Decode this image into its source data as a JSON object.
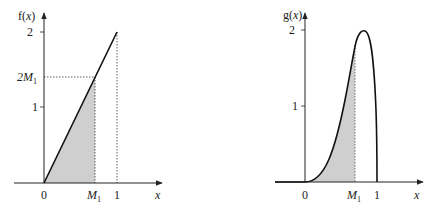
{
  "chart_data": [
    {
      "type": "line",
      "title": "",
      "ylabel": "f(x)",
      "xlabel": "x",
      "function": "f(x) = 2x on [0,1]",
      "x": [
        0,
        0.7,
        1
      ],
      "values": [
        0,
        1.4,
        2
      ],
      "x_ticks": [
        "0",
        "M1",
        "1"
      ],
      "y_ticks": [
        "1",
        "2M1",
        "2"
      ],
      "y_tick_values": [
        1,
        1.4,
        2
      ],
      "shaded_region": {
        "from": 0,
        "to": "M1",
        "color": "#cfcfcf"
      },
      "reference_lines": [
        "dotted horizontal at 2M1",
        "dotted vertical at M1",
        "dotted vertical at 1"
      ],
      "xlim": [
        -0.4,
        1.6
      ],
      "ylim": [
        0,
        2.2
      ],
      "grid": false,
      "labels": {
        "y_axis": "f(x)",
        "x_axis": "x",
        "tick_0": "0",
        "tick_m1": "M",
        "tick_m1_sub": "1",
        "tick_1": "1",
        "ytick_1": "1",
        "ytick_2": "2",
        "ytick_2m1": "2M",
        "ytick_2m1_sub": "1"
      }
    },
    {
      "type": "line",
      "title": "",
      "ylabel": "g(x)",
      "xlabel": "x",
      "x": [
        0,
        0.2,
        0.4,
        0.6,
        0.7,
        0.77,
        0.9,
        1.0
      ],
      "values": [
        0,
        0.1,
        0.55,
        1.35,
        1.8,
        2.0,
        1.5,
        0
      ],
      "x_ticks": [
        "0",
        "M1",
        "1"
      ],
      "y_ticks": [
        "1",
        "2"
      ],
      "peak": {
        "x": 0.77,
        "y": 2.0
      },
      "shaded_region": {
        "from": 0,
        "to": "M1",
        "color": "#cfcfcf"
      },
      "xlim": [
        -0.4,
        1.6
      ],
      "ylim": [
        0,
        2.2
      ],
      "grid": false,
      "labels": {
        "y_axis": "g(x)",
        "x_axis": "x",
        "tick_0": "0",
        "tick_m1": "M",
        "tick_m1_sub": "1",
        "tick_1": "1",
        "ytick_1": "1",
        "ytick_2": "2"
      }
    }
  ]
}
